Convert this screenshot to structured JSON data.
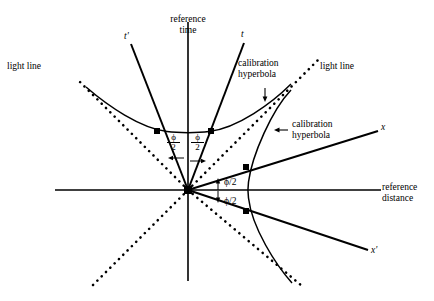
{
  "figure": {
    "type": "minkowski-spacetime-diagram",
    "title": "",
    "background_color": "#ffffff",
    "line_color": "#000000",
    "width": 434,
    "height": 301
  },
  "labels": {
    "reference_time_line1": "reference",
    "reference_time_line2": "time",
    "reference_distance_line1": "reference",
    "reference_distance_line2": "distance",
    "light_line_left": "light line",
    "light_line_right": "light line",
    "calibration_hyperbola_upper_line1": "calibration",
    "calibration_hyperbola_upper_line2": "hyperbola",
    "calibration_hyperbola_right_line1": "calibration",
    "calibration_hyperbola_right_line2": "hyperbola",
    "axis_t_prime": "t'",
    "axis_t": "t",
    "axis_x": "x",
    "axis_x_prime": "x'",
    "angle_phi_left_numerator": "ϕ",
    "angle_phi_left_denominator": "2",
    "angle_phi_right_numerator": "ϕ",
    "angle_phi_right_denominator": "2",
    "angle_phi_above_x": "ϕ/2",
    "angle_phi_below_x": "ϕ/2",
    "arrow_down_to_upper_hyperbola": "↓",
    "arrow_left_to_right_hyperbola": "←",
    "arrow_up_above_x_axis": "↑",
    "arrow_down_below_x_axis": "↓",
    "arrow_left_phi_half": "←",
    "arrow_right_phi_half": "→"
  },
  "geometry": {
    "origin_x": 188,
    "origin_y": 190,
    "reference_time_axis": {
      "x": 188,
      "y_top": 22,
      "y_bottom": 281
    },
    "reference_distance_axis": {
      "y": 190,
      "x_left": 55,
      "x_right": 381
    },
    "t_prime_axis": {
      "x1": 188,
      "y1": 190,
      "x2": 131,
      "y2": 44
    },
    "t_axis": {
      "x1": 188,
      "y1": 190,
      "x2": 244,
      "y2": 43
    },
    "x_axis_prime_upper": {
      "x1": 188,
      "y1": 190,
      "x2": 378,
      "y2": 131
    },
    "x_axis_prime_lower": {
      "x1": 188,
      "y1": 190,
      "x2": 368,
      "y2": 250
    },
    "light_line_upper_left": {
      "x1": 77,
      "y1": 79,
      "x2": 188,
      "y2": 190
    },
    "light_line_upper_right": {
      "x1": 188,
      "y1": 190,
      "x2": 317,
      "y2": 61
    },
    "light_line_lower_left": {
      "x1": 188,
      "y1": 190,
      "x2": 90,
      "y2": 288
    },
    "light_line_lower_right": {
      "x1": 188,
      "y1": 190,
      "x2": 301,
      "y2": 285
    },
    "upper_hyperbola_vertex": {
      "x": 188,
      "y": 130
    },
    "right_hyperbola_vertex": {
      "x": 248,
      "y": 190
    },
    "marker_points": [
      {
        "x": 157,
        "y": 131,
        "label": "t-prime-upper-hyperbola-intersection"
      },
      {
        "x": 211,
        "y": 131,
        "label": "t-upper-hyperbola-intersection"
      },
      {
        "x": 246,
        "y": 167,
        "label": "x-right-hyperbola-intersection"
      },
      {
        "x": 246,
        "y": 211,
        "label": "x-prime-right-hyperbola-intersection"
      },
      {
        "x": 188,
        "y": 190,
        "label": "origin"
      }
    ]
  }
}
